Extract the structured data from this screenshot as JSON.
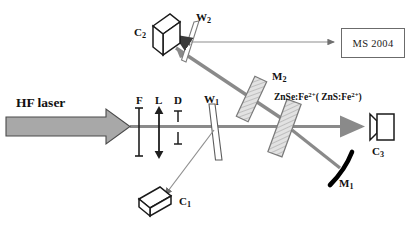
{
  "figure": {
    "background_color": "#ffffff",
    "beam_color": "#8a8a8a",
    "mirror_color": "#000000",
    "outline_color": "#1a1a1a"
  },
  "labels": {
    "source": "HF laser",
    "filter": "F",
    "lens": "L",
    "diaphragm": "D",
    "wedge1_base": "W",
    "wedge1_sub": "1",
    "wedge2_base": "W",
    "wedge2_sub": "2",
    "mirror1_base": "M",
    "mirror1_sub": "1",
    "mirror2_base": "M",
    "mirror2_sub": "2",
    "detector1_base": "C",
    "detector1_sub": "1",
    "detector2_base": "C",
    "detector2_sub": "2",
    "detector3_base": "C",
    "detector3_sub": "3",
    "crystal_main": "ZnSe:Fe",
    "crystal_main_sup": "2+",
    "crystal_alt_open": "( ZnS:Fe",
    "crystal_alt_sup": "2+",
    "crystal_alt_close": ")",
    "spectrometer": "MS 2004"
  },
  "components": [
    {
      "name": "hf-laser-arrow",
      "label": "HF laser",
      "type": "block-arrow"
    },
    {
      "name": "filter-f",
      "label": "F",
      "type": "optical-filter"
    },
    {
      "name": "lens-l",
      "label": "L",
      "type": "lens"
    },
    {
      "name": "diaphragm-d",
      "label": "D",
      "type": "aperture"
    },
    {
      "name": "wedge-w1",
      "label": "W1",
      "type": "wedge-beamsplitter"
    },
    {
      "name": "wedge-w2",
      "label": "W2",
      "type": "wedge-beamsplitter"
    },
    {
      "name": "mirror-m1",
      "label": "M1",
      "type": "curved-mirror"
    },
    {
      "name": "mirror-m2",
      "label": "M2",
      "type": "flat-mirror"
    },
    {
      "name": "crystal-znse",
      "label": "ZnSe:Fe2+ (ZnS:Fe2+)",
      "type": "laser-crystal"
    },
    {
      "name": "detector-c1",
      "label": "C1",
      "type": "detector"
    },
    {
      "name": "detector-c2",
      "label": "C2",
      "type": "detector"
    },
    {
      "name": "detector-c3",
      "label": "C3",
      "type": "detector"
    },
    {
      "name": "spectrometer-ms2004",
      "label": "MS 2004",
      "type": "spectrometer"
    }
  ]
}
